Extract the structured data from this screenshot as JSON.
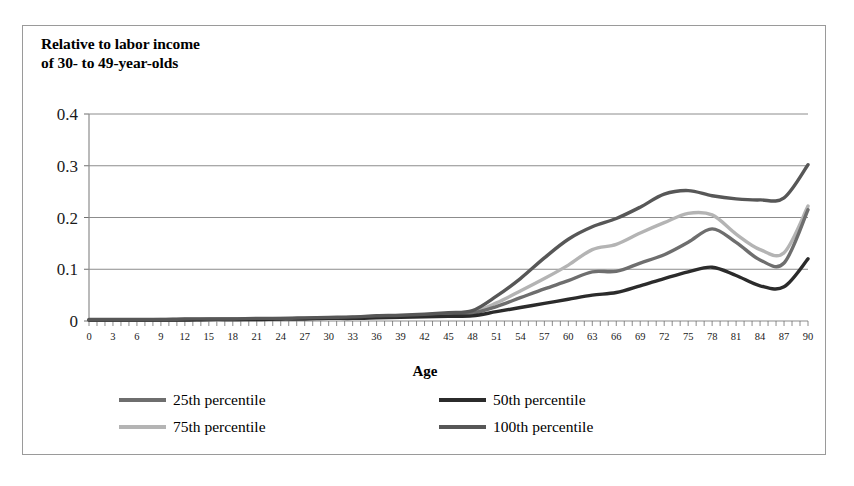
{
  "figure": {
    "title": "Relative to labor income\nof 30- to 49-year-olds",
    "x_axis_title": "Age"
  },
  "legend": {
    "position": "bottom",
    "entries": [
      {
        "label": "25th percentile",
        "color": "#6e6e6e",
        "swatch": "line-swatch-25th"
      },
      {
        "label": "50th percentile",
        "color": "#2b2b2b",
        "swatch": "line-swatch-50th"
      },
      {
        "label": "75th percentile",
        "color": "#b4b4b4",
        "swatch": "line-swatch-75th"
      },
      {
        "label": "100th percentile",
        "color": "#575757",
        "swatch": "line-swatch-100th"
      }
    ]
  },
  "chart_data": {
    "type": "line",
    "title": "Relative to labor income of 30- to 49-year-olds",
    "xlabel": "Age",
    "ylabel": "Relative to labor income of 30- to 49-year-olds",
    "xlim": [
      0,
      90
    ],
    "ylim": [
      0,
      0.4
    ],
    "ytick_labels": [
      "0",
      "0.1",
      "0.2",
      "0.3",
      "0.4"
    ],
    "yticks": [
      0,
      0.1,
      0.2,
      0.3,
      0.4
    ],
    "grid": "horizontal",
    "legend_position": "bottom",
    "x": [
      0,
      3,
      6,
      9,
      12,
      15,
      18,
      21,
      24,
      27,
      30,
      33,
      36,
      39,
      42,
      45,
      48,
      51,
      54,
      57,
      60,
      63,
      66,
      69,
      72,
      75,
      78,
      81,
      84,
      87,
      90
    ],
    "xtick_labels": [
      "0",
      "3",
      "6",
      "9",
      "12",
      "15",
      "18",
      "21",
      "24",
      "27",
      "30",
      "33",
      "36",
      "39",
      "42",
      "45",
      "48",
      "51",
      "54",
      "57",
      "60",
      "63",
      "66",
      "69",
      "72",
      "75",
      "78",
      "81",
      "84",
      "87",
      "90"
    ],
    "series": [
      {
        "name": "25th percentile",
        "color": "#6e6e6e",
        "values": [
          0.002,
          0.002,
          0.002,
          0.002,
          0.003,
          0.003,
          0.003,
          0.004,
          0.004,
          0.005,
          0.006,
          0.007,
          0.008,
          0.009,
          0.011,
          0.013,
          0.015,
          0.028,
          0.045,
          0.062,
          0.078,
          0.095,
          0.096,
          0.112,
          0.128,
          0.152,
          0.178,
          0.152,
          0.118,
          0.112,
          0.215
        ]
      },
      {
        "name": "50th percentile",
        "color": "#2b2b2b",
        "values": [
          0.002,
          0.002,
          0.002,
          0.002,
          0.002,
          0.003,
          0.003,
          0.003,
          0.004,
          0.004,
          0.005,
          0.005,
          0.006,
          0.007,
          0.008,
          0.009,
          0.01,
          0.018,
          0.026,
          0.034,
          0.042,
          0.05,
          0.055,
          0.068,
          0.082,
          0.095,
          0.104,
          0.088,
          0.068,
          0.066,
          0.12
        ]
      },
      {
        "name": "75th percentile",
        "color": "#b4b4b4",
        "values": [
          0.002,
          0.002,
          0.002,
          0.003,
          0.003,
          0.003,
          0.004,
          0.004,
          0.005,
          0.005,
          0.006,
          0.007,
          0.009,
          0.01,
          0.012,
          0.014,
          0.017,
          0.035,
          0.058,
          0.082,
          0.108,
          0.138,
          0.148,
          0.17,
          0.19,
          0.208,
          0.205,
          0.168,
          0.138,
          0.132,
          0.222
        ]
      },
      {
        "name": "100th percentile",
        "color": "#575757",
        "values": [
          0.003,
          0.003,
          0.003,
          0.003,
          0.004,
          0.004,
          0.004,
          0.005,
          0.005,
          0.006,
          0.007,
          0.008,
          0.01,
          0.011,
          0.013,
          0.016,
          0.02,
          0.048,
          0.082,
          0.122,
          0.158,
          0.182,
          0.198,
          0.22,
          0.245,
          0.252,
          0.242,
          0.236,
          0.234,
          0.238,
          0.302
        ]
      }
    ]
  }
}
